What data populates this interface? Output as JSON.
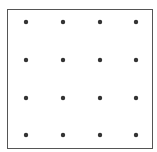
{
  "diagram": {
    "type": "dot-grid",
    "rows": 4,
    "cols": 4,
    "dot_color": "#333333",
    "border_color": "#555555",
    "dots_x": [
      26,
      63,
      100,
      136
    ],
    "dots_y": [
      22,
      60,
      98,
      135
    ]
  }
}
